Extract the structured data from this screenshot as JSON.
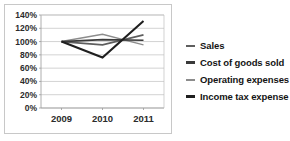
{
  "chart_data": {
    "type": "line",
    "title": "",
    "subtitle": "",
    "xlabel": "",
    "ylabel": "",
    "categories": [
      "2009",
      "2010",
      "2011"
    ],
    "x": [
      2009,
      2010,
      2011
    ],
    "ylim": [
      0,
      140
    ],
    "yticks": [
      0,
      20,
      40,
      60,
      80,
      100,
      120,
      140
    ],
    "ytick_labels": [
      "0%",
      "20%",
      "40%",
      "60%",
      "80%",
      "100%",
      "120%",
      "140%"
    ],
    "xtick_labels": [
      "2009",
      "2010",
      "2011"
    ],
    "grid": "horizontal",
    "legend_position": "right",
    "value_suffix": "%",
    "series": [
      {
        "name": "Sales",
        "values": [
          100,
          95,
          110
        ],
        "color": "#5e5e5e"
      },
      {
        "name": "Cost of goods sold",
        "values": [
          100,
          103,
          102
        ],
        "color": "#3a3a3a"
      },
      {
        "name": "Operating expenses",
        "values": [
          100,
          111,
          95
        ],
        "color": "#8c8c8c"
      },
      {
        "name": "Income tax expense",
        "values": [
          100,
          76,
          131
        ],
        "color": "#1f1f1f"
      }
    ]
  },
  "legend": {
    "items": [
      {
        "label": "Sales"
      },
      {
        "label": "Cost of goods sold"
      },
      {
        "label": "Operating expenses"
      },
      {
        "label": "Income tax expense"
      }
    ]
  }
}
